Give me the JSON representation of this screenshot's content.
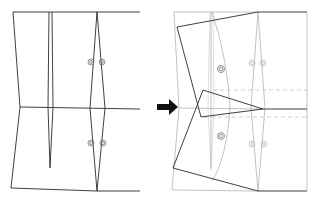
{
  "diagram": {
    "colors": {
      "line": "#2a2a2a",
      "ghost_line": "#a8a8a8",
      "faint_line": "#c8c8c8",
      "dashed_guide": "#c4c4c4",
      "arrow": "#111111"
    },
    "panels": [
      {
        "id": "original-block",
        "label": "",
        "elements": [
          "outline",
          "waist-line",
          "narrow-dart",
          "diamond-dart",
          "balance-marks"
        ]
      },
      {
        "id": "transformed-block",
        "label": "",
        "elements": [
          "ghost-outline",
          "rotated-outline",
          "dashed-guides",
          "ghost-darts",
          "balance-marks"
        ]
      }
    ],
    "arrow": {
      "direction": "right",
      "meaning": "transforms-into"
    }
  }
}
